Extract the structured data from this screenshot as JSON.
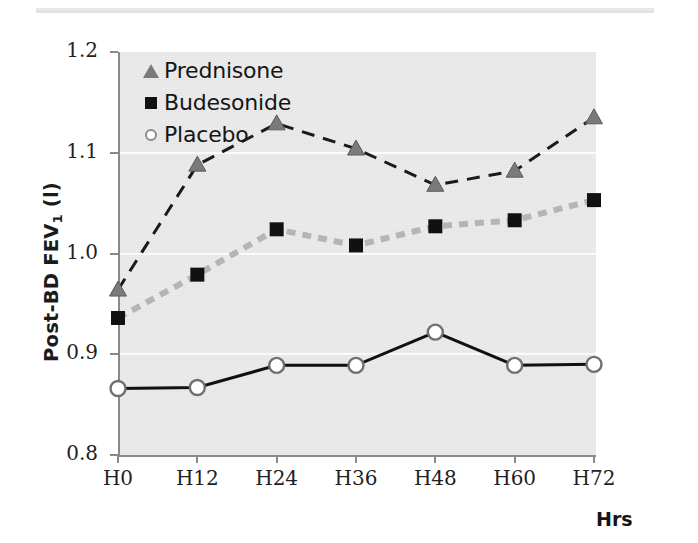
{
  "figure": {
    "ylabel_main": "Post-BD FEV",
    "ylabel_sub": "1",
    "ylabel_unit": " (l)",
    "xlabel": "Hrs",
    "plot_bg": "#e9e9e9",
    "gridline_color": "#fbfbfb",
    "axis_color": "#8a8a8a"
  },
  "legend": {
    "position": "top-left-inside",
    "items": [
      {
        "label": "Prednisone",
        "marker": "triangle",
        "color": "#7a7a7a",
        "line_style": "dashed"
      },
      {
        "label": "Budesonide",
        "marker": "square",
        "color": "#111111",
        "line_style": "dotted-thick-gray"
      },
      {
        "label": "Placebo",
        "marker": "circle-open",
        "color": "#111111",
        "line_style": "solid"
      }
    ]
  },
  "chart_data": {
    "type": "line",
    "title": "",
    "subtitle": "",
    "xlabel": "Hrs",
    "ylabel": "Post-BD FEV1 (l)",
    "categories": [
      "H0",
      "H12",
      "H24",
      "H36",
      "H48",
      "H60",
      "H72"
    ],
    "x_tick_labels": [
      "H0",
      "H12",
      "H24",
      "H36",
      "H48",
      "H60",
      "H72"
    ],
    "y_tick_labels": [
      "1.2",
      "1.1",
      "1.0",
      "0.9",
      "0.8"
    ],
    "y_ticks": [
      1.2,
      1.1,
      1.0,
      0.9,
      0.8
    ],
    "ylim": [
      0.8,
      1.2
    ],
    "grid": true,
    "grid_axis": "y",
    "legend_position": "upper left",
    "series": [
      {
        "name": "Prednisone",
        "marker": "triangle",
        "marker_color": "#7a7a7a",
        "line_color": "#1a1a1a",
        "line_style": "dashed",
        "values": [
          0.964,
          1.088,
          1.129,
          1.104,
          1.068,
          1.082,
          1.135
        ]
      },
      {
        "name": "Budesonide",
        "marker": "square",
        "marker_color": "#111111",
        "line_color": "#b5b5b5",
        "line_style": "dotted",
        "values": [
          0.936,
          0.979,
          1.024,
          1.008,
          1.027,
          1.033,
          1.053
        ]
      },
      {
        "name": "Placebo",
        "marker": "circle-open",
        "marker_color": "#ffffff",
        "line_color": "#111111",
        "line_style": "solid",
        "values": [
          0.866,
          0.867,
          0.889,
          0.889,
          0.922,
          0.889,
          0.89
        ]
      }
    ]
  }
}
